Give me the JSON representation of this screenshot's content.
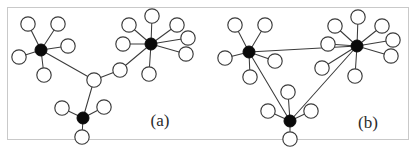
{
  "figure": {
    "width": 416,
    "height": 153,
    "background_color": "#ffffff",
    "frame": {
      "x": 7,
      "y": 7,
      "width": 402,
      "height": 133,
      "stroke_color": "#c9c9c9"
    },
    "edge_color": "#3b3b3b",
    "hub_color": "#0a0a0a",
    "leaf_fill_color": "#ffffff",
    "leaf_stroke_color": "#3b3b3b",
    "hub_radius": 6,
    "leaf_radius": 7.2
  },
  "chart_data": {
    "type": "diagram",
    "title": "",
    "panels": [
      {
        "id": "a",
        "label": "(a)",
        "label_x": 160,
        "label_y": 126,
        "nodes": [
          {
            "id": "a_hub_left",
            "kind": "hub",
            "x": 41,
            "y": 50
          },
          {
            "id": "a_hub_right",
            "kind": "hub",
            "x": 151,
            "y": 44
          },
          {
            "id": "a_hub_bottom",
            "kind": "hub",
            "x": 83,
            "y": 118
          },
          {
            "id": "a_junction",
            "kind": "leaf",
            "x": 94,
            "y": 80
          },
          {
            "id": "a_bridge",
            "kind": "leaf",
            "x": 120,
            "y": 70
          },
          {
            "id": "a_l1",
            "kind": "leaf",
            "x": 28,
            "y": 24
          },
          {
            "id": "a_l2",
            "kind": "leaf",
            "x": 58,
            "y": 24
          },
          {
            "id": "a_l3",
            "kind": "leaf",
            "x": 19,
            "y": 57
          },
          {
            "id": "a_l4",
            "kind": "leaf",
            "x": 68,
            "y": 46
          },
          {
            "id": "a_l5",
            "kind": "leaf",
            "x": 44,
            "y": 75
          },
          {
            "id": "a_r1",
            "kind": "leaf",
            "x": 129,
            "y": 25
          },
          {
            "id": "a_r2",
            "kind": "leaf",
            "x": 152,
            "y": 16
          },
          {
            "id": "a_r3",
            "kind": "leaf",
            "x": 177,
            "y": 25
          },
          {
            "id": "a_r4",
            "kind": "leaf",
            "x": 123,
            "y": 44
          },
          {
            "id": "a_r5",
            "kind": "leaf",
            "x": 188,
            "y": 38
          },
          {
            "id": "a_r6",
            "kind": "leaf",
            "x": 186,
            "y": 54
          },
          {
            "id": "a_r7",
            "kind": "leaf",
            "x": 149,
            "y": 74
          },
          {
            "id": "a_b1",
            "kind": "leaf",
            "x": 62,
            "y": 108
          },
          {
            "id": "a_b2",
            "kind": "leaf",
            "x": 104,
            "y": 107
          },
          {
            "id": "a_b3",
            "kind": "leaf",
            "x": 82,
            "y": 137
          }
        ],
        "edges": [
          [
            "a_hub_left",
            "a_l1"
          ],
          [
            "a_hub_left",
            "a_l2"
          ],
          [
            "a_hub_left",
            "a_l3"
          ],
          [
            "a_hub_left",
            "a_l4"
          ],
          [
            "a_hub_left",
            "a_l5"
          ],
          [
            "a_hub_right",
            "a_r1"
          ],
          [
            "a_hub_right",
            "a_r2"
          ],
          [
            "a_hub_right",
            "a_r3"
          ],
          [
            "a_hub_right",
            "a_r4"
          ],
          [
            "a_hub_right",
            "a_r5"
          ],
          [
            "a_hub_right",
            "a_r6"
          ],
          [
            "a_hub_right",
            "a_r7"
          ],
          [
            "a_hub_bottom",
            "a_b1"
          ],
          [
            "a_hub_bottom",
            "a_b2"
          ],
          [
            "a_hub_bottom",
            "a_b3"
          ],
          [
            "a_hub_left",
            "a_junction"
          ],
          [
            "a_junction",
            "a_bridge"
          ],
          [
            "a_bridge",
            "a_hub_right"
          ],
          [
            "a_junction",
            "a_hub_bottom"
          ]
        ],
        "hub_count": 3,
        "leaf_count": 17,
        "topology": "tree"
      },
      {
        "id": "b",
        "label": "(b)",
        "label_x": 368,
        "label_y": 128,
        "nodes": [
          {
            "id": "b_hub_left",
            "kind": "hub",
            "x": 249,
            "y": 52
          },
          {
            "id": "b_hub_right",
            "kind": "hub",
            "x": 357,
            "y": 46
          },
          {
            "id": "b_hub_bottom",
            "kind": "hub",
            "x": 290,
            "y": 121
          },
          {
            "id": "b_l1",
            "kind": "leaf",
            "x": 235,
            "y": 25
          },
          {
            "id": "b_l2",
            "kind": "leaf",
            "x": 265,
            "y": 25
          },
          {
            "id": "b_l3",
            "kind": "leaf",
            "x": 225,
            "y": 58
          },
          {
            "id": "b_l4",
            "kind": "leaf",
            "x": 275,
            "y": 61
          },
          {
            "id": "b_l5",
            "kind": "leaf",
            "x": 250,
            "y": 77
          },
          {
            "id": "b_r1",
            "kind": "leaf",
            "x": 335,
            "y": 26
          },
          {
            "id": "b_r2",
            "kind": "leaf",
            "x": 358,
            "y": 17
          },
          {
            "id": "b_r3",
            "kind": "leaf",
            "x": 382,
            "y": 26
          },
          {
            "id": "b_r4",
            "kind": "leaf",
            "x": 328,
            "y": 44
          },
          {
            "id": "b_r5",
            "kind": "leaf",
            "x": 393,
            "y": 40
          },
          {
            "id": "b_r6",
            "kind": "leaf",
            "x": 391,
            "y": 56
          },
          {
            "id": "b_r7",
            "kind": "leaf",
            "x": 355,
            "y": 76
          },
          {
            "id": "b_r8",
            "kind": "leaf",
            "x": 322,
            "y": 68
          },
          {
            "id": "b_b1",
            "kind": "leaf",
            "x": 268,
            "y": 111
          },
          {
            "id": "b_b2",
            "kind": "leaf",
            "x": 311,
            "y": 111
          },
          {
            "id": "b_b3",
            "kind": "leaf",
            "x": 290,
            "y": 139
          },
          {
            "id": "b_b4",
            "kind": "leaf",
            "x": 288,
            "y": 92
          }
        ],
        "edges": [
          [
            "b_hub_left",
            "b_l1"
          ],
          [
            "b_hub_left",
            "b_l2"
          ],
          [
            "b_hub_left",
            "b_l3"
          ],
          [
            "b_hub_left",
            "b_l4"
          ],
          [
            "b_hub_left",
            "b_l5"
          ],
          [
            "b_hub_right",
            "b_r1"
          ],
          [
            "b_hub_right",
            "b_r2"
          ],
          [
            "b_hub_right",
            "b_r3"
          ],
          [
            "b_hub_right",
            "b_r4"
          ],
          [
            "b_hub_right",
            "b_r5"
          ],
          [
            "b_hub_right",
            "b_r6"
          ],
          [
            "b_hub_right",
            "b_r7"
          ],
          [
            "b_hub_right",
            "b_r8"
          ],
          [
            "b_hub_bottom",
            "b_b1"
          ],
          [
            "b_hub_bottom",
            "b_b2"
          ],
          [
            "b_hub_bottom",
            "b_b3"
          ],
          [
            "b_hub_bottom",
            "b_b4"
          ],
          [
            "b_hub_left",
            "b_hub_right"
          ],
          [
            "b_hub_left",
            "b_hub_bottom"
          ],
          [
            "b_hub_bottom",
            "b_hub_right"
          ]
        ],
        "hub_count": 3,
        "leaf_count": 17,
        "topology": "triangle"
      }
    ]
  }
}
